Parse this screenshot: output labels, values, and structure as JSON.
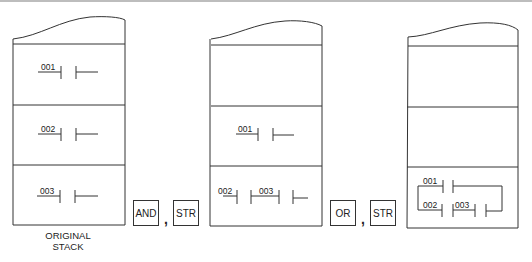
{
  "figure": {
    "stacks": [
      {
        "id": "original",
        "caption_line1": "ORIGINAL",
        "caption_line2": "STACK",
        "rows": [
          {
            "contacts": [
              "001"
            ]
          },
          {
            "contacts": [
              "002"
            ]
          },
          {
            "contacts": [
              "003"
            ]
          }
        ]
      },
      {
        "id": "after-and-str",
        "rows": [
          {
            "contacts": []
          },
          {
            "contacts": [
              "001"
            ]
          },
          {
            "contacts": [
              "002",
              "003"
            ]
          }
        ]
      },
      {
        "id": "after-or-str",
        "rows": [
          {
            "contacts": []
          },
          {
            "contacts": []
          },
          {
            "contacts": [
              "001",
              "002",
              "003"
            ],
            "branch": "001 OR (002 AND 003)"
          }
        ]
      }
    ],
    "operations": [
      {
        "op1": "AND",
        "separator": ",",
        "op2": "STR"
      },
      {
        "op1": "OR",
        "separator": ",",
        "op2": "STR"
      }
    ]
  }
}
